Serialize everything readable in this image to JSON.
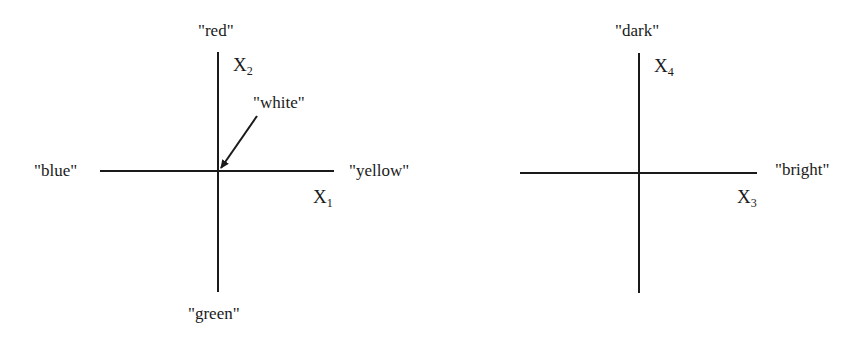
{
  "diagram": {
    "left_panel": {
      "axes": {
        "horizontal": {
          "name": "X",
          "subscript": "1",
          "positive_end": "\"yellow\"",
          "negative_end": "\"blue\""
        },
        "vertical": {
          "name": "X",
          "subscript": "2",
          "positive_end": "\"red\"",
          "negative_end": "\"green\""
        }
      },
      "origin_label": "\"white\"",
      "origin_arrow": "arrow pointing from \"white\" label to origin"
    },
    "right_panel": {
      "axes": {
        "horizontal": {
          "name": "X",
          "subscript": "3",
          "positive_end": "\"bright\""
        },
        "vertical": {
          "name": "X",
          "subscript": "4",
          "positive_end": "\"dark\""
        }
      }
    },
    "colors": {
      "line": "#1a1a1a",
      "background": "#ffffff"
    }
  }
}
